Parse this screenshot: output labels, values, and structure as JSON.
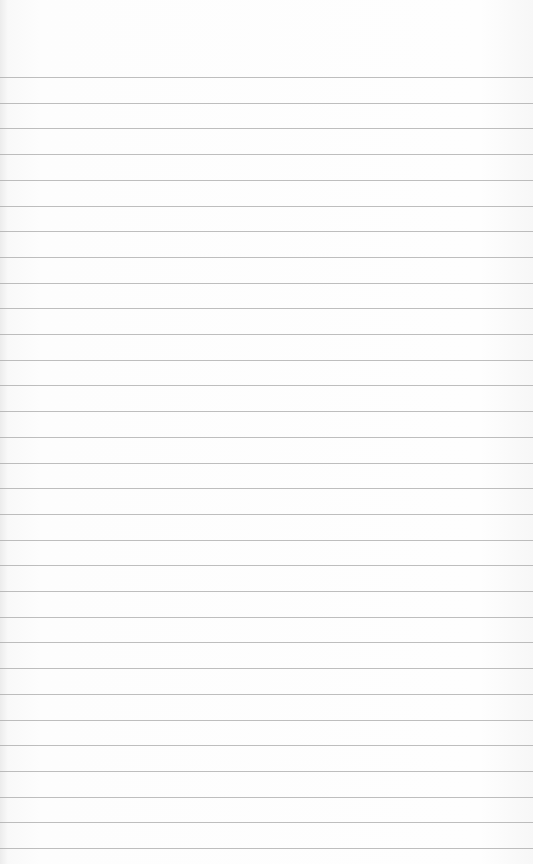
{
  "paper": {
    "type": "lined-paper",
    "line_color": "#a8a8a8",
    "background_color": "#fbfbfb",
    "first_line_y": 77,
    "line_spacing": 25.7,
    "line_count": 31
  }
}
